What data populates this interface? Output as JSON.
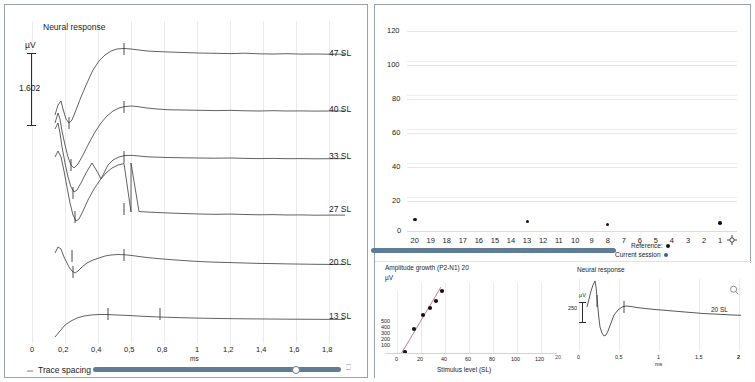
{
  "left_panel": {
    "title": "Neural response",
    "y_unit": "µV",
    "scalebar_value": "1.602",
    "x_axis_label": "ms",
    "x_ticks": [
      "0",
      "0,2",
      "0,4",
      "0,5",
      "0,8",
      "1",
      "1,2",
      "1,4",
      "1,6",
      "1,8"
    ],
    "trace_labels": [
      "47 SL",
      "40 SL",
      "33 SL",
      "27 SL",
      "20 SL",
      "13 SL"
    ],
    "slider": {
      "label": "Trace spacing",
      "value_percent": 82,
      "left_icon": "sliders-icon",
      "right_icon": "trash-icon"
    }
  },
  "right_panel": {
    "scatter": {
      "y_ticks": [
        "120",
        "100",
        "80",
        "60",
        "40",
        "20",
        "0"
      ],
      "x_ticks": [
        "20",
        "19",
        "18",
        "17",
        "16",
        "15",
        "14",
        "13",
        "12",
        "11",
        "10",
        "9",
        "8",
        "7",
        "6",
        "5",
        "4",
        "3",
        "2",
        "1"
      ],
      "x_end_icon": "crosshair-icon",
      "legend": [
        {
          "label": "Reference:",
          "color": "#141414",
          "name": "reference"
        },
        {
          "label": "Current session",
          "color": "#38618f",
          "name": "current-session"
        }
      ],
      "slider_value_percent": 64
    },
    "amplitude_chart": {
      "title": "Amplitude growth (P2-N1) 20",
      "y_unit": "µV",
      "y_ticks": [
        "500",
        "400",
        "300",
        "200",
        "100"
      ],
      "x_ticks": [
        "0",
        "20",
        "40",
        "60",
        "80",
        "100",
        "120"
      ],
      "x_axis_label": "Stimulus level (SL)",
      "fit_line_color": "#c36a7e"
    },
    "response_chart": {
      "title": "Neural response",
      "y_unit": "µV",
      "scalebar_value": "250",
      "x_ticks": [
        "0",
        "0,5",
        "1",
        "1,5",
        "2"
      ],
      "x_axis_label": "ms",
      "trace_label": "20 SL",
      "zoom_icon": "magnifier-icon",
      "left_edge_tick": "20"
    }
  },
  "chart_data": [
    {
      "type": "line",
      "name": "neural-response-stack",
      "title": "Neural response",
      "xlabel": "ms",
      "ylabel": "µV",
      "xlim": [
        0,
        1.95
      ],
      "grid": true,
      "legend_position": "right",
      "scalebar": "1.602",
      "series": [
        {
          "name": "47 SL",
          "baseline_y": 49
        },
        {
          "name": "40 SL",
          "baseline_y": 105
        },
        {
          "name": "33 SL",
          "baseline_y": 152
        },
        {
          "name": "27 SL",
          "baseline_y": 205
        },
        {
          "name": "20 SL",
          "baseline_y": 258
        },
        {
          "name": "13 SL",
          "baseline_y": 312
        }
      ],
      "x_tick_values": [
        0,
        0.2,
        0.4,
        0.5,
        0.8,
        1.0,
        1.2,
        1.4,
        1.6,
        1.8
      ]
    },
    {
      "type": "scatter",
      "name": "session-overview-scatter",
      "title": "",
      "xlabel": "",
      "ylabel": "",
      "ylim": [
        0,
        125
      ],
      "y_tick_values": [
        0,
        20,
        40,
        60,
        80,
        100,
        120
      ],
      "x_tick_values": [
        20,
        19,
        18,
        17,
        16,
        15,
        14,
        13,
        12,
        11,
        10,
        9,
        8,
        7,
        6,
        5,
        4,
        3,
        2,
        1
      ],
      "x_descending": true,
      "grid": true,
      "legend_position": "bottom-right",
      "series": [
        {
          "name": "Reference:",
          "color": "#141414",
          "points": [
            {
              "x": 20,
              "y": 7
            },
            {
              "x": 13,
              "y": 6
            },
            {
              "x": 8,
              "y": 4
            },
            {
              "x": 1,
              "y": 5
            }
          ]
        },
        {
          "name": "Current session",
          "color": "#38618f",
          "points": []
        }
      ]
    },
    {
      "type": "scatter",
      "name": "amplitude-growth",
      "title": "Amplitude growth (P2-N1) 20",
      "xlabel": "Stimulus level (SL)",
      "ylabel": "µV",
      "xlim": [
        0,
        125
      ],
      "ylim": [
        0,
        560
      ],
      "x_tick_values": [
        0,
        20,
        40,
        60,
        80,
        100,
        120
      ],
      "y_tick_values": [
        100,
        200,
        300,
        400,
        500
      ],
      "grid": true,
      "legend_position": "none",
      "series": [
        {
          "name": "P2-N1 amplitude",
          "color": "#141414",
          "points": [
            {
              "x": 13,
              "y": 80
            },
            {
              "x": 20,
              "y": 330
            },
            {
              "x": 27,
              "y": 420
            },
            {
              "x": 33,
              "y": 470
            },
            {
              "x": 40,
              "y": 520
            },
            {
              "x": 47,
              "y": 585
            }
          ]
        },
        {
          "name": "linear fit",
          "color": "#c36a7e",
          "fit": true
        }
      ]
    },
    {
      "type": "line",
      "name": "neural-response-single",
      "title": "Neural response",
      "xlabel": "ms",
      "ylabel": "µV",
      "xlim": [
        0,
        2.05
      ],
      "x_tick_values": [
        0,
        0.5,
        1.0,
        1.5,
        2.0
      ],
      "grid": true,
      "legend_position": "right",
      "scalebar": "250",
      "series": [
        {
          "name": "20 SL"
        }
      ]
    }
  ]
}
